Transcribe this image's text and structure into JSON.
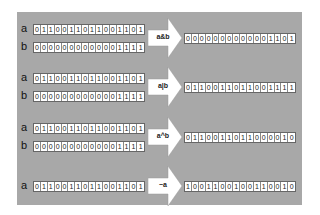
{
  "colors": {
    "panel": "#a8a8a8",
    "cell_bg": "#ffffff",
    "arrow": "#ffffff"
  },
  "groups": [
    {
      "operator": "a&b",
      "inputs": [
        {
          "name": "a",
          "bits": "0110011011001101"
        },
        {
          "name": "b",
          "bits": "0000000000001111"
        }
      ],
      "result": "0000000000001101"
    },
    {
      "operator": "a|b",
      "inputs": [
        {
          "name": "a",
          "bits": "0110011011001101"
        },
        {
          "name": "b",
          "bits": "0000000000001111"
        }
      ],
      "result": "0110011011001111"
    },
    {
      "operator": "a^b",
      "inputs": [
        {
          "name": "a",
          "bits": "0110011011001101"
        },
        {
          "name": "b",
          "bits": "0000000000001111"
        }
      ],
      "result": "0110011011000010"
    },
    {
      "operator": "~a",
      "inputs": [
        {
          "name": "a",
          "bits": "0110011011001101"
        }
      ],
      "result": "1001100100110010"
    }
  ]
}
